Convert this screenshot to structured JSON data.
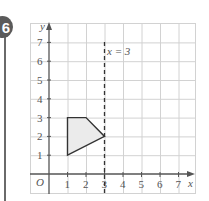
{
  "question": {
    "number": "6"
  },
  "chart_data": {
    "type": "diagram",
    "title": "",
    "xlabel": "x",
    "ylabel": "y",
    "origin_label": "O",
    "x_ticks": [
      "1",
      "2",
      "3",
      "4",
      "5",
      "6",
      "7"
    ],
    "y_ticks": [
      "1",
      "2",
      "3",
      "4",
      "5",
      "6",
      "7"
    ],
    "xlim": [
      -1,
      7.9
    ],
    "ylim": [
      -1,
      8
    ],
    "grid": true,
    "shape": {
      "vertices": [
        [
          1,
          3
        ],
        [
          2,
          3
        ],
        [
          3,
          2
        ],
        [
          1,
          1
        ]
      ],
      "fill": "#ebebeb",
      "stroke": "#333333"
    },
    "mirror_line": {
      "equation": "x = 3",
      "x": 3,
      "style": "dashed"
    }
  },
  "labels": {
    "y_axis": "y",
    "x_axis": "x",
    "origin": "O",
    "mirror_line": "x = 3"
  },
  "colors": {
    "grid": "#cfcfcf",
    "axis": "#555555",
    "badge": "#5a5a5a",
    "shape_fill": "#ebebeb"
  }
}
